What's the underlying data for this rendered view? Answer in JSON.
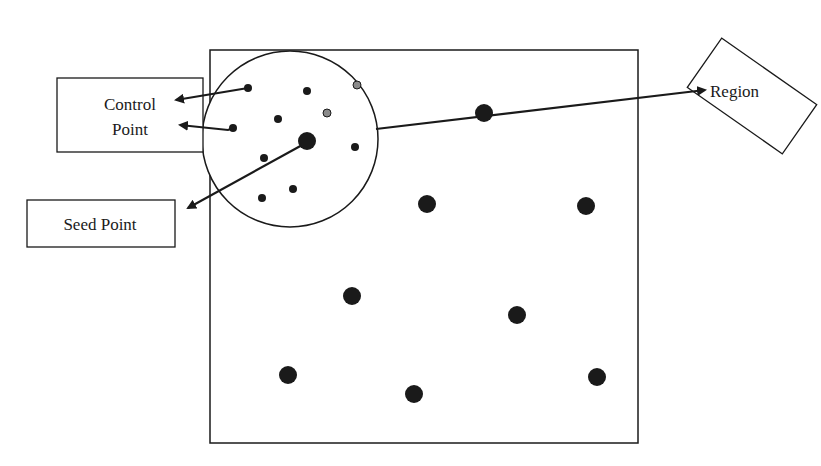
{
  "diagram": {
    "labels": {
      "control_point": [
        "Control",
        "Point"
      ],
      "seed_point": "Seed Point",
      "region": "Region"
    },
    "colors": {
      "stroke": "#1a1a1a",
      "dot": "#1a1a1a",
      "gray_dot": "#8a8a8a",
      "background": "#ffffff"
    },
    "image_frame": {
      "x": 210,
      "y": 50,
      "width": 428,
      "height": 393
    },
    "region_circle": {
      "cx": 290,
      "cy": 139,
      "r": 88
    },
    "seed_point": {
      "x": 307,
      "y": 141,
      "r": 9
    },
    "control_points": [
      {
        "x": 248,
        "y": 88
      },
      {
        "x": 233,
        "y": 128
      }
    ],
    "region_small_points": [
      {
        "x": 307,
        "y": 91,
        "gray": false
      },
      {
        "x": 357,
        "y": 85,
        "gray": true
      },
      {
        "x": 278,
        "y": 119,
        "gray": false
      },
      {
        "x": 327,
        "y": 113,
        "gray": true
      },
      {
        "x": 355,
        "y": 147,
        "gray": false
      },
      {
        "x": 264,
        "y": 158,
        "gray": false
      },
      {
        "x": 293,
        "y": 189,
        "gray": false
      },
      {
        "x": 262,
        "y": 198,
        "gray": false
      }
    ],
    "other_seed_points": [
      {
        "x": 484,
        "y": 113
      },
      {
        "x": 427,
        "y": 204
      },
      {
        "x": 586,
        "y": 206
      },
      {
        "x": 352,
        "y": 296
      },
      {
        "x": 517,
        "y": 315
      },
      {
        "x": 288,
        "y": 375
      },
      {
        "x": 414,
        "y": 394
      },
      {
        "x": 597,
        "y": 377
      }
    ]
  }
}
